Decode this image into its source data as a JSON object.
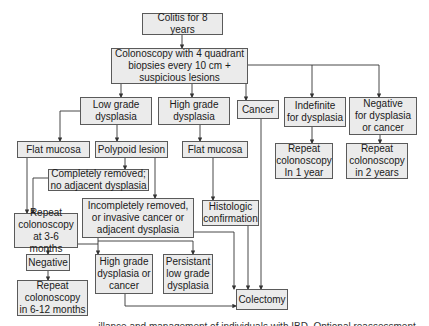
{
  "diagram": {
    "colors": {
      "box_fill": "#ebebeb",
      "box_border": "#5a5a5a",
      "line": "#333333"
    },
    "nodes": {
      "colitis": "Colitis for 8 years",
      "colonoscopy": "Colonoscopy with 4 quadrant\nbiopsies every 10 cm +\nsuspicious lesions",
      "low_grade": "Low grade\ndysplasia",
      "high_grade": "High grade\ndysplasia",
      "cancer": "Cancer",
      "indefinite": "Indefinite\nfor dysplasia",
      "negative": "Negative\nfor dysplasia\nor cancer",
      "flat_mucosa_left": "Flat mucosa",
      "polypoid": "Polypoid lesion",
      "flat_mucosa_center": "Flat mucosa",
      "repeat_1yr": "Repeat\ncolonoscopy\nIn 1 year",
      "repeat_2yr": "Repeat\ncolonoscopy\nin 2 years",
      "completely_removed": "Completely removed;\nno adjacent dysplasia",
      "histologic": "Histologic\nconfirmation",
      "incompletely_removed": "Incompletely removed,\nor invasive cancer or\nadjacent dysplasia",
      "repeat_3_6": "Repeat\ncolonoscopy\nat 3-6 months",
      "negative_result": "Negative",
      "hgd_or_cancer": "High grade\ndysplasia or\ncancer",
      "persistant_lgd": "Persistant\nlow grade\ndysplasia",
      "repeat_6_12": "Repeat\ncolonoscopy\nin 6-12 months",
      "colectomy": "Colectomy"
    },
    "caption": "...illance and management of individuals with IBD. Optional reassessment..."
  }
}
